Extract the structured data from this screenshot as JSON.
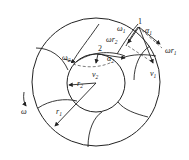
{
  "diagram": {
    "type": "vane-pump velocity diagram",
    "points": {
      "p1": "1",
      "p2": "2"
    },
    "labels": {
      "omega": "ω",
      "omega1": "ω",
      "omega1_sub": "1",
      "omega2": "ω",
      "omega2_sub": "2",
      "alpha1": "α",
      "alpha1_sub": "1",
      "alpha2": "α",
      "alpha2_sub": "2",
      "omega_r1": "ωr",
      "omega_r1_sub": "1",
      "omega_r2": "ωr",
      "omega_r2_sub": "2",
      "v1": "v",
      "v1_sub": "1",
      "v2": "v",
      "v2_sub": "2",
      "r1": "r",
      "r1_sub": "1",
      "r2": "r",
      "r2_sub": "2"
    },
    "colors": {
      "stroke": "#222222",
      "background": "#ffffff"
    }
  }
}
